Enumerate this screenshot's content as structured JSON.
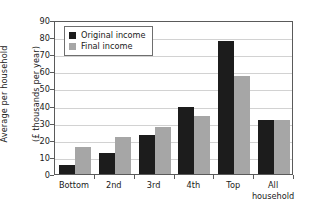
{
  "chart_data": {
    "type": "bar",
    "title": "",
    "subtitle": "",
    "xlabel": "",
    "ylabel": "Average per household\n(£ thousands per year)",
    "ylabel_lines": [
      "Average per household",
      "(£ thousands per year)"
    ],
    "categories": [
      "Bottom",
      "2nd",
      "3rd",
      "4th",
      "Top",
      "All"
    ],
    "category_sublabels": [
      "",
      "",
      "",
      "",
      "",
      "household"
    ],
    "series": [
      {
        "name": "Original income",
        "color": "#1c1c1c",
        "values": [
          5,
          12,
          23,
          39,
          78,
          31.5
        ]
      },
      {
        "name": "Final income",
        "color": "#a6a6a6",
        "values": [
          16,
          21.5,
          27.5,
          34,
          57.5,
          31.5
        ]
      }
    ],
    "ylim": [
      0,
      90
    ],
    "ytick_values": [
      0,
      10,
      20,
      30,
      40,
      50,
      60,
      70,
      80,
      90
    ],
    "ytick_labels": [
      "0",
      "10",
      "20",
      "30",
      "40",
      "50",
      "60",
      "70",
      "80",
      "90"
    ],
    "grid": true,
    "grid_axis": "y",
    "legend_position": "upper left",
    "legend_entries": [
      "Original income",
      "Final income"
    ]
  },
  "legend": {
    "items": [
      {
        "label": "Original income",
        "swatch": "original"
      },
      {
        "label": "Final income",
        "swatch": "final"
      }
    ]
  }
}
